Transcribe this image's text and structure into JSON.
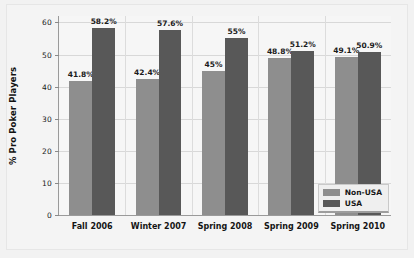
{
  "chart_data": {
    "type": "bar",
    "title": "",
    "xlabel": "",
    "ylabel": "% Pro Poker Players",
    "ylim": [
      0,
      62
    ],
    "yticks": [
      0,
      10,
      20,
      30,
      40,
      50,
      60
    ],
    "ytick_labels": [
      "0",
      "10",
      "20",
      "30",
      "40",
      "50",
      "60"
    ],
    "grid": true,
    "legend_position": "lower right",
    "categories": [
      "Fall 2006",
      "Winter 2007",
      "Spring 2008",
      "Spring 2009",
      "Spring 2010"
    ],
    "series": [
      {
        "name": "Non-USA",
        "color": "#8e8e8e",
        "values": [
          41.8,
          42.4,
          45,
          48.8,
          49.1
        ],
        "labels": [
          "41.8%",
          "42.4%",
          "45%",
          "48.8%",
          "49.1%"
        ]
      },
      {
        "name": "USA",
        "color": "#585858",
        "values": [
          58.2,
          57.6,
          55,
          51.2,
          50.9
        ],
        "labels": [
          "58.2%",
          "57.6%",
          "55%",
          "51.2%",
          "50.9%"
        ]
      }
    ]
  },
  "legend": {
    "items": [
      {
        "label": "Non-USA",
        "color": "#8e8e8e"
      },
      {
        "label": "USA",
        "color": "#585858"
      }
    ]
  }
}
